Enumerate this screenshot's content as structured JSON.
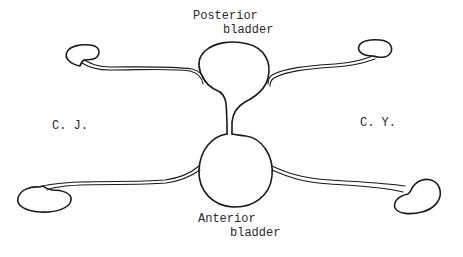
{
  "diagram": {
    "labels": {
      "posterior_line1": "Posterior",
      "posterior_line2": "bladder",
      "anterior_line1": "Anterior",
      "anterior_line2": "bladder",
      "left_subject": "C. J.",
      "right_subject": "C. Y."
    },
    "structures": [
      "posterior-bladder",
      "anterior-bladder",
      "bladder-connecting-channel",
      "kidney-upper-left",
      "kidney-upper-right",
      "kidney-lower-left",
      "kidney-lower-right",
      "ureter-upper-left",
      "ureter-upper-right",
      "ureter-lower-left",
      "ureter-lower-right"
    ],
    "colors": {
      "line": "#1a1a1a",
      "background": "#ffffff",
      "text": "#2a2a2a"
    }
  }
}
